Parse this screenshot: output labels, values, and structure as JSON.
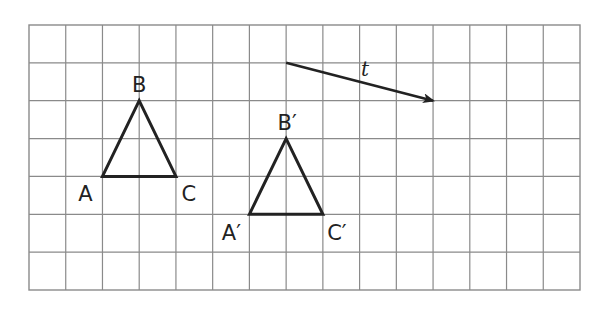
{
  "diagram": {
    "type": "translation-on-grid",
    "grid": {
      "left": 29,
      "top": 25,
      "right": 580,
      "bottom": 290,
      "cols": 15,
      "rows": 7,
      "line_color": "#8a8a8a"
    },
    "shape_color": "#222222",
    "triangles": [
      {
        "name": "original",
        "vertices": [
          {
            "label": "A",
            "col": 2,
            "row": 4,
            "label_dx": -17,
            "label_dy": 25
          },
          {
            "label": "B",
            "col": 3,
            "row": 2,
            "label_dx": 0,
            "label_dy": -9
          },
          {
            "label": "C",
            "col": 4,
            "row": 4,
            "label_dx": 13,
            "label_dy": 25
          }
        ]
      },
      {
        "name": "image",
        "vertices": [
          {
            "label": "A′",
            "col": 6,
            "row": 5,
            "label_dx": -18,
            "label_dy": 26
          },
          {
            "label": "B′",
            "col": 7,
            "row": 3,
            "label_dx": 1,
            "label_dy": -9
          },
          {
            "label": "C′",
            "col": 8,
            "row": 5,
            "label_dx": 14,
            "label_dy": 26
          }
        ]
      }
    ],
    "vector": {
      "label": "t",
      "from": {
        "col": 7,
        "row": 1
      },
      "to": {
        "col": 11,
        "row": 2
      },
      "label_pos": {
        "x": 365,
        "y": 76
      }
    }
  }
}
